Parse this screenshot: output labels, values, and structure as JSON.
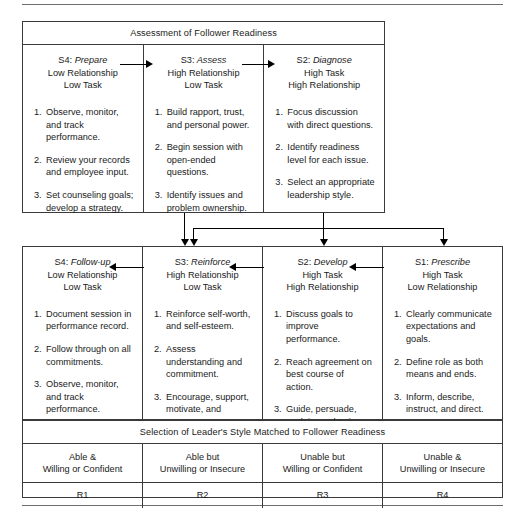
{
  "diagram": {
    "title_assessment": "Assessment of Follower Readiness",
    "title_selection": "Selection of Leader's Style Matched to Follower Readiness"
  },
  "assessment": {
    "header": "Assessment of Follower Readiness",
    "columns": [
      {
        "style_code": "S4:",
        "style_name": "Prepare",
        "line2": "Low Relationship",
        "line3": "Low Task",
        "items": [
          {
            "num": "1.",
            "text": "Observe, monitor, and track performance."
          },
          {
            "num": "2.",
            "text": "Review your records and employee input."
          },
          {
            "num": "3.",
            "text": "Set counseling goals; develop a strategy."
          }
        ]
      },
      {
        "style_code": "S3:",
        "style_name": "Assess",
        "line2": "High Relationship",
        "line3": "Low Task",
        "items": [
          {
            "num": "1.",
            "text": "Build rapport, trust, and personal power."
          },
          {
            "num": "2.",
            "text": "Begin session with open-ended questions."
          },
          {
            "num": "3.",
            "text": "Identify issues and problem ownership."
          }
        ]
      },
      {
        "style_code": "S2:",
        "style_name": "Diagnose",
        "line2": "High Task",
        "line3": "High Relationship",
        "items": [
          {
            "num": "1.",
            "text": "Focus discussion with direct questions."
          },
          {
            "num": "2.",
            "text": "Identify readiness level for each issue."
          },
          {
            "num": "3.",
            "text": "Select an appropriate leadership style."
          }
        ]
      }
    ]
  },
  "selection": {
    "header": "Selection of Leader's Style Matched to Follower Readiness",
    "columns": [
      {
        "style_code": "S4:",
        "style_name": "Follow-up",
        "line2": "Low Relationship",
        "line3": "Low Task",
        "items": [
          {
            "num": "1.",
            "text": "Document session in performance record."
          },
          {
            "num": "2.",
            "text": "Follow through on all commitments."
          },
          {
            "num": "3.",
            "text": "Observe, monitor, and track performance."
          }
        ]
      },
      {
        "style_code": "S3:",
        "style_name": "Reinforce",
        "line2": "High Relationship",
        "line3": "Low Task",
        "items": [
          {
            "num": "1.",
            "text": "Reinforce self-worth, and self-esteem."
          },
          {
            "num": "2.",
            "text": "Assess understanding and commitment."
          },
          {
            "num": "3.",
            "text": "Encourage, support, motivate, and empower."
          }
        ]
      },
      {
        "style_code": "S2:",
        "style_name": "Develop",
        "line2": "High Task",
        "line3": "High Relationship",
        "items": [
          {
            "num": "1.",
            "text": "Discuss goals to improve performance."
          },
          {
            "num": "2.",
            "text": "Reach agreement on best course of action."
          },
          {
            "num": "3.",
            "text": "Guide, persuade, explain, and train."
          }
        ]
      },
      {
        "style_code": "S1:",
        "style_name": "Prescribe",
        "line2": "High Task",
        "line3": "Low Relationship",
        "items": [
          {
            "num": "1.",
            "text": "Clearly communicate expectations and goals."
          },
          {
            "num": "2.",
            "text": "Define role as both means and ends."
          },
          {
            "num": "3.",
            "text": "Inform, describe, instruct, and direct."
          }
        ]
      }
    ]
  },
  "readiness": {
    "descriptors": [
      {
        "line1": "Able &",
        "line2": "Willing or Confident"
      },
      {
        "line1": "Able but",
        "line2": "Unwilling or Insecure"
      },
      {
        "line1": "Unable but",
        "line2": "Willing or Confident"
      },
      {
        "line1": "Unable &",
        "line2": "Unwilling or Insecure"
      }
    ],
    "levels": [
      "R1",
      "R2",
      "R3",
      "R4"
    ]
  },
  "colors": {
    "border": "#3a3a3a",
    "arrow": "#000000",
    "rule": "#6e6e6e",
    "text": "#1a1a1a"
  }
}
